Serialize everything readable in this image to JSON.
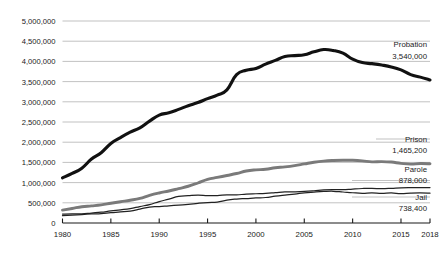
{
  "chart_data": {
    "type": "line",
    "title": "",
    "subtitle": "",
    "xlabel": "",
    "ylabel": "",
    "xlim": [
      1980,
      2018
    ],
    "ylim": [
      0,
      5000000
    ],
    "grid": true,
    "legend_position": "right-inline",
    "x_ticks": [
      "1980",
      "1985",
      "1990",
      "1995",
      "2000",
      "2005",
      "2010",
      "2015",
      "2018"
    ],
    "x_tick_values": [
      1980,
      1985,
      1990,
      1995,
      2000,
      2005,
      2010,
      2015,
      2018
    ],
    "y_ticks": [
      "0",
      "500,000",
      "1,000,000",
      "1,500,000",
      "2,000,000",
      "2,500,000",
      "3,000,000",
      "3,500,000",
      "4,000,000",
      "4,500,000",
      "5,000,000"
    ],
    "y_tick_values": [
      0,
      500000,
      1000000,
      1500000,
      2000000,
      2500000,
      3000000,
      3500000,
      4000000,
      4500000,
      5000000
    ],
    "x": [
      1980,
      1981,
      1982,
      1983,
      1984,
      1985,
      1986,
      1987,
      1988,
      1989,
      1990,
      1991,
      1992,
      1993,
      1994,
      1995,
      1996,
      1997,
      1998,
      1999,
      2000,
      2001,
      2002,
      2003,
      2004,
      2005,
      2006,
      2007,
      2008,
      2009,
      2010,
      2011,
      2012,
      2013,
      2014,
      2015,
      2016,
      2017,
      2018
    ],
    "series": [
      {
        "name": "Probation",
        "color": "#111111",
        "end_label": "Probation",
        "end_value_label": "3,540,000",
        "end_value": 3540000,
        "values": [
          1118097,
          1225934,
          1357264,
          1582947,
          1740948,
          1968712,
          2114621,
          2247158,
          2356483,
          2522125,
          2670234,
          2728472,
          2811611,
          2903061,
          2981022,
          3077861,
          3164996,
          3296513,
          3670441,
          3779922,
          3826209,
          3931731,
          4024067,
          4120012,
          4143792,
          4162536,
          4236800,
          4293000,
          4271000,
          4203967,
          4055514,
          3971319,
          3944170,
          3910647,
          3864167,
          3789800,
          3673100,
          3610800,
          3540000
        ]
      },
      {
        "name": "Prison",
        "color": "#7a7a7a",
        "end_label": "Prison",
        "end_value_label": "1,465,200",
        "end_value": 1465200,
        "values": [
          319598,
          360029,
          402914,
          423898,
          448264,
          487593,
          526436,
          562814,
          607766,
          683367,
          743382,
          792535,
          850566,
          909381,
          990147,
          1078542,
          1127528,
          1176564,
          1224469,
          1287172,
          1316333,
          1330007,
          1367547,
          1390279,
          1421345,
          1462866,
          1504598,
          1532851,
          1547742,
          1553574,
          1552669,
          1538847,
          1512430,
          1520403,
          1508636,
          1476847,
          1458173,
          1471300,
          1465200
        ]
      },
      {
        "name": "Parole",
        "color": "#222222",
        "end_label": "Parole",
        "end_value_label": "878,000",
        "end_value": 878000,
        "values": [
          220438,
          225539,
          224604,
          246440,
          266992,
          300203,
          325638,
          355505,
          407977,
          456803,
          531407,
          590442,
          658601,
          676100,
          690371,
          679421,
          679733,
          694787,
          696385,
          714457,
          723898,
          732333,
          750934,
          769925,
          771852,
          780616,
          798202,
          821177,
          828169,
          824365,
          840676,
          853852,
          858391,
          849500,
          857700,
          870500,
          874800,
          875000,
          878000
        ]
      },
      {
        "name": "Jail",
        "color": "#222222",
        "end_label": "Jail",
        "end_value_label": "738,400",
        "end_value": 738400,
        "values": [
          182288,
          195085,
          209582,
          223551,
          234500,
          256615,
          274444,
          295873,
          343569,
          395553,
          405320,
          426479,
          444584,
          459804,
          486474,
          507044,
          518492,
          567079,
          592462,
          605943,
          621149,
          631240,
          665475,
          691301,
          713990,
          747529,
          765819,
          780174,
          785533,
          767434,
          748728,
          735601,
          744524,
          731208,
          744592,
          727400,
          740700,
          745200,
          738400
        ]
      }
    ],
    "annotations": [
      {
        "series": "Probation",
        "label": "Probation",
        "value": "3,540,000"
      },
      {
        "series": "Prison",
        "label": "Prison",
        "value": "1,465,200"
      },
      {
        "series": "Parole",
        "label": "Parole",
        "value": "878,000"
      },
      {
        "series": "Jail",
        "label": "Jail",
        "value": "738,400"
      }
    ]
  }
}
